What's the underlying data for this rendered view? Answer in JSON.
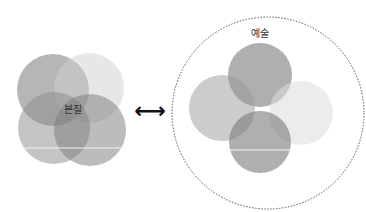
{
  "left_group": {
    "label": "본질",
    "circles": [
      {
        "cx": 53,
        "cy": 90,
        "r": 36,
        "fill": "#7a7a7a",
        "opacity": 0.55
      },
      {
        "cx": 89,
        "cy": 88,
        "r": 35,
        "fill": "#cfcfcf",
        "opacity": 0.5
      },
      {
        "cx": 54,
        "cy": 128,
        "r": 36,
        "fill": "#8a8a8a",
        "opacity": 0.5
      },
      {
        "cx": 90,
        "cy": 130,
        "r": 36,
        "fill": "#7a7a7a",
        "opacity": 0.5
      }
    ]
  },
  "arrow": {
    "symbol": "⟷"
  },
  "right_group": {
    "label": "예술",
    "boundary": {
      "cx": 268,
      "cy": 113,
      "r": 96,
      "stroke": "#555"
    },
    "circles": [
      {
        "cx": 260,
        "cy": 75,
        "r": 32,
        "fill": "#7a7a7a",
        "opacity": 0.6
      },
      {
        "cx": 222,
        "cy": 108,
        "r": 33,
        "fill": "#999",
        "opacity": 0.5
      },
      {
        "cx": 301,
        "cy": 113,
        "r": 32,
        "fill": "#dcdcdc",
        "opacity": 0.55
      },
      {
        "cx": 260,
        "cy": 142,
        "r": 31,
        "fill": "#7a7a7a",
        "opacity": 0.6
      }
    ]
  }
}
